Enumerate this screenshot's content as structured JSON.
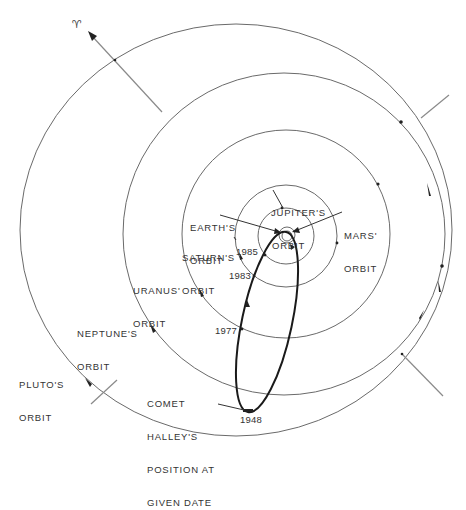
{
  "diagram": {
    "vernal_equinox_symbol": "♈",
    "labels": {
      "earth": [
        "EARTH'S",
        "ORBIT"
      ],
      "jupiter": [
        "JUPITER'S",
        "ORBIT"
      ],
      "mars": [
        "MARS'",
        "ORBIT"
      ],
      "saturn": [
        "SATURN'S",
        "ORBIT"
      ],
      "uranus": [
        "URANUS'",
        "ORBIT"
      ],
      "neptune": [
        "NEPTUNE'S",
        "ORBIT"
      ],
      "pluto": [
        "PLUTO'S",
        "ORBIT"
      ],
      "comet": [
        "COMET",
        "HALLEY'S",
        "POSITION AT",
        "GIVEN DATE"
      ]
    },
    "comet_positions": [
      {
        "year": "1985"
      },
      {
        "year": "1983"
      },
      {
        "year": "1977"
      },
      {
        "year": "1948"
      }
    ],
    "colors": {
      "orbit": "#6a6a6a",
      "comet_path": "#1a1a1a",
      "text": "#333333",
      "background": "#ffffff"
    }
  }
}
